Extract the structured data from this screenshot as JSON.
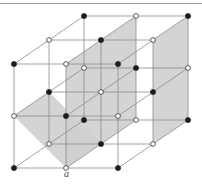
{
  "figure": {
    "label": "a",
    "label_pos": [
      64,
      178
    ],
    "colors": {
      "line": "#8a8a8a",
      "shade": "#cfcfcf",
      "black_atom": "#1a1a1a",
      "white_atom": "#ffffff",
      "atom_stroke": "#333333"
    },
    "lattice": {
      "origin": [
        84,
        16
      ],
      "x_step": [
        52,
        0
      ],
      "y_step": [
        0,
        52
      ],
      "z_step": [
        -35,
        24
      ],
      "size": 3
    },
    "atoms": [
      {
        "i": 0,
        "j": 0,
        "k": 0,
        "type": "black"
      },
      {
        "i": 1,
        "j": 0,
        "k": 0,
        "type": "white"
      },
      {
        "i": 2,
        "j": 0,
        "k": 0,
        "type": "black"
      },
      {
        "i": 0,
        "j": 1,
        "k": 0,
        "type": "white"
      },
      {
        "i": 1,
        "j": 1,
        "k": 0,
        "type": "black"
      },
      {
        "i": 2,
        "j": 1,
        "k": 0,
        "type": "white"
      },
      {
        "i": 0,
        "j": 2,
        "k": 0,
        "type": "black"
      },
      {
        "i": 1,
        "j": 2,
        "k": 0,
        "type": "white"
      },
      {
        "i": 2,
        "j": 2,
        "k": 0,
        "type": "black"
      },
      {
        "i": 0,
        "j": 0,
        "k": 1,
        "type": "white"
      },
      {
        "i": 1,
        "j": 0,
        "k": 1,
        "type": "black"
      },
      {
        "i": 2,
        "j": 0,
        "k": 1,
        "type": "white"
      },
      {
        "i": 0,
        "j": 1,
        "k": 1,
        "type": "black"
      },
      {
        "i": 1,
        "j": 1,
        "k": 1,
        "type": "white"
      },
      {
        "i": 2,
        "j": 1,
        "k": 1,
        "type": "black"
      },
      {
        "i": 0,
        "j": 2,
        "k": 1,
        "type": "white"
      },
      {
        "i": 1,
        "j": 2,
        "k": 1,
        "type": "black"
      },
      {
        "i": 2,
        "j": 2,
        "k": 1,
        "type": "white"
      },
      {
        "i": 0,
        "j": 0,
        "k": 2,
        "type": "black"
      },
      {
        "i": 1,
        "j": 0,
        "k": 2,
        "type": "white"
      },
      {
        "i": 2,
        "j": 0,
        "k": 2,
        "type": "black"
      },
      {
        "i": 0,
        "j": 1,
        "k": 2,
        "type": "white"
      },
      {
        "i": 1,
        "j": 1,
        "k": 2,
        "type": "black"
      },
      {
        "i": 2,
        "j": 1,
        "k": 2,
        "type": "white"
      },
      {
        "i": 0,
        "j": 2,
        "k": 2,
        "type": "black"
      },
      {
        "i": 1,
        "j": 2,
        "k": 2,
        "type": "white"
      },
      {
        "i": 2,
        "j": 2,
        "k": 2,
        "type": "black"
      }
    ],
    "shaded_planes": [
      {
        "name": "vertical-plane-center",
        "corners": [
          [
            1,
            0,
            0
          ],
          [
            1,
            2,
            0
          ],
          [
            1,
            2,
            2
          ],
          [
            1,
            0,
            2
          ]
        ]
      },
      {
        "name": "vertical-plane-right",
        "corners": [
          [
            2,
            0,
            0
          ],
          [
            2,
            2,
            0
          ],
          [
            2,
            2,
            1
          ],
          [
            2,
            0,
            1
          ]
        ]
      },
      {
        "name": "diagonal-plane-left",
        "corners": [
          [
            0,
            1,
            2
          ],
          [
            1,
            2,
            2
          ],
          [
            1,
            2,
            1
          ],
          [
            0,
            1,
            1
          ]
        ]
      }
    ]
  }
}
